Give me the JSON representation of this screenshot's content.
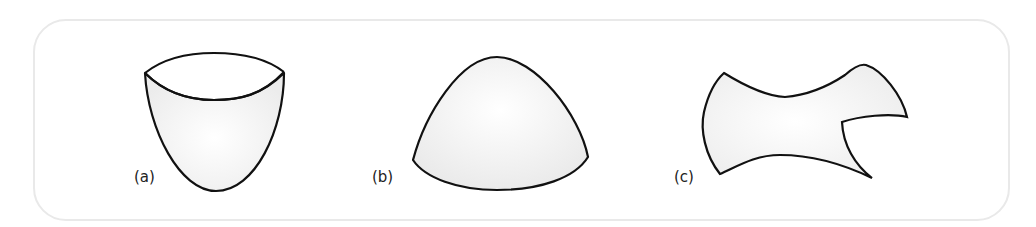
{
  "figure": {
    "panels": [
      {
        "id": "a",
        "label": "(a)",
        "shape": "bowl-paraboloid-surface",
        "label_pos": [
          134,
          168
        ]
      },
      {
        "id": "b",
        "label": "(b)",
        "shape": "dome-surface-patch",
        "label_pos": [
          372,
          168
        ]
      },
      {
        "id": "c",
        "label": "(c)",
        "shape": "irregular-surface-patch",
        "label_pos": [
          674,
          168
        ]
      }
    ],
    "colors": {
      "frame_stroke": "#e9e9e9",
      "outline": "#111111",
      "fill": "#f3f3f3"
    }
  }
}
